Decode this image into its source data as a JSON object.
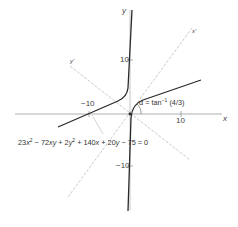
{
  "figure": {
    "equation": {
      "parts": {
        "c1": "23",
        "v1": "x",
        "e1": "2",
        "op1": " − 72",
        "v2": "xy",
        "op2": " + 2",
        "v3": "y",
        "e3": "2",
        "op3": " + 140",
        "v4": "x",
        "op4": " + 20",
        "v5": "y",
        "op5": " − 75 = 0"
      },
      "full_text": "23x² − 72xy + 2y² + 140x + 20y − 75 = 0"
    },
    "angle_label": {
      "prefix": "α = tan",
      "exponent": "−1",
      "suffix": " (4/3)",
      "full_text": "α = tan⁻¹ (4/3)"
    },
    "axes": {
      "x_label": "x",
      "y_label": "y",
      "x_prime_label": "x'",
      "y_prime_label": "y'",
      "x_ticks": [
        "−10",
        "10"
      ],
      "y_ticks": [
        "10",
        "−10"
      ]
    },
    "colors": {
      "curve": "#2a2a2a",
      "axis": "#9a9a9a",
      "rotated_axis": "#b5b5b5",
      "text": "#444444"
    }
  }
}
